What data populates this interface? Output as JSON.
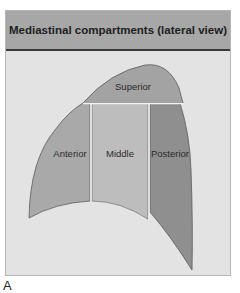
{
  "figure": {
    "title": "Mediastinal compartments (lateral view)",
    "caption": "A",
    "compartments": [
      {
        "name": "superior",
        "label": "Superior",
        "color": "#a3a3a3"
      },
      {
        "name": "anterior",
        "label": "Anterior",
        "color": "#a9a9a9"
      },
      {
        "name": "middle",
        "label": "Middle",
        "color": "#bdbdbd"
      },
      {
        "name": "posterior",
        "label": "Posterior",
        "color": "#8f8f8f"
      }
    ],
    "colors": {
      "header_bg": "#a7a7a7",
      "panel_bg": "#e3e3e3",
      "outline": "#5a5a5a",
      "divider": "#f2f2f2"
    }
  }
}
